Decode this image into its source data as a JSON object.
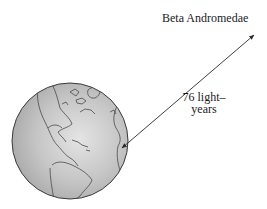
{
  "diagram": {
    "star_label": "Beta Andromedae",
    "distance_label_line1": "76 light–",
    "distance_label_line2": "years",
    "globe": {
      "name": "earth-globe",
      "center": [
        70,
        141
      ],
      "radius": 58,
      "fill": "#bdbdbd",
      "highlight": "#e2e2e2",
      "outline": "#3a3a3a"
    },
    "arrow": {
      "start": [
        122,
        148
      ],
      "end": [
        254,
        35
      ],
      "color": "#2a2a2a",
      "double_headed": true
    }
  }
}
